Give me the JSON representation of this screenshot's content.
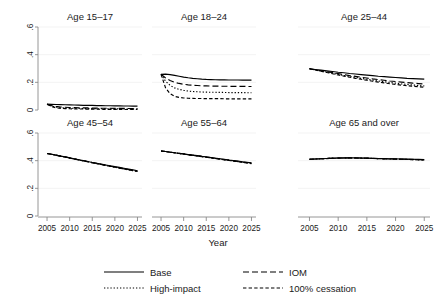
{
  "figure": {
    "xlabel": "Year",
    "y_ticks": [
      "0",
      ".2",
      ".4",
      ".6"
    ],
    "x_ticks": [
      "2005",
      "2010",
      "2015",
      "2020",
      "2025"
    ]
  },
  "legend": {
    "items": [
      {
        "label": "Base",
        "style": "solid",
        "key": "base"
      },
      {
        "label": "IOM",
        "style": "dashed",
        "key": "iom"
      },
      {
        "label": "High-impact",
        "style": "dotted",
        "key": "high_impact"
      },
      {
        "label": "100% cessation",
        "style": "dash-dot",
        "key": "cessation"
      }
    ]
  },
  "chart_data": {
    "type": "line",
    "title": "",
    "xlabel": "Year",
    "ylabel": "",
    "xlim": [
      2003,
      2026
    ],
    "ylim": [
      0,
      0.6
    ],
    "x_ticks": [
      2005,
      2010,
      2015,
      2020,
      2025
    ],
    "y_ticks": [
      0,
      0.2,
      0.4,
      0.6
    ],
    "grid": true,
    "legend_position": "bottom",
    "x": [
      2005,
      2006,
      2007,
      2008,
      2009,
      2010,
      2011,
      2012,
      2013,
      2014,
      2015,
      2016,
      2017,
      2018,
      2019,
      2020,
      2021,
      2022,
      2023,
      2024,
      2025
    ],
    "panels": [
      {
        "title": "Age 15–17",
        "series": [
          {
            "name": "Base",
            "style": "solid",
            "values": [
              0.042,
              0.041,
              0.04,
              0.039,
              0.038,
              0.037,
              0.036,
              0.035,
              0.034,
              0.034,
              0.033,
              0.032,
              0.032,
              0.031,
              0.031,
              0.03,
              0.03,
              0.029,
              0.029,
              0.028,
              0.028
            ]
          },
          {
            "name": "IOM",
            "style": "dashed",
            "values": [
              0.042,
              0.032,
              0.026,
              0.022,
              0.02,
              0.018,
              0.017,
              0.016,
              0.015,
              0.015,
              0.014,
              0.014,
              0.013,
              0.013,
              0.013,
              0.012,
              0.012,
              0.012,
              0.011,
              0.011,
              0.011
            ]
          },
          {
            "name": "High-impact",
            "style": "dotted",
            "values": [
              0.042,
              0.028,
              0.021,
              0.017,
              0.015,
              0.013,
              0.012,
              0.011,
              0.011,
              0.01,
              0.01,
              0.009,
              0.009,
              0.009,
              0.008,
              0.008,
              0.008,
              0.008,
              0.007,
              0.007,
              0.007
            ]
          },
          {
            "name": "100% cessation",
            "style": "dash-dot",
            "values": [
              0.042,
              0.024,
              0.016,
              0.012,
              0.01,
              0.009,
              0.008,
              0.007,
              0.007,
              0.006,
              0.006,
              0.006,
              0.005,
              0.005,
              0.005,
              0.005,
              0.004,
              0.004,
              0.004,
              0.004,
              0.004
            ]
          }
        ]
      },
      {
        "title": "Age 18–24",
        "series": [
          {
            "name": "Base",
            "style": "solid",
            "values": [
              0.258,
              0.259,
              0.256,
              0.25,
              0.244,
              0.238,
              0.233,
              0.229,
              0.226,
              0.223,
              0.221,
              0.22,
              0.219,
              0.218,
              0.218,
              0.217,
              0.217,
              0.217,
              0.216,
              0.216,
              0.216
            ]
          },
          {
            "name": "IOM",
            "style": "dashed",
            "values": [
              0.258,
              0.232,
              0.213,
              0.2,
              0.192,
              0.186,
              0.182,
              0.179,
              0.177,
              0.175,
              0.174,
              0.173,
              0.173,
              0.172,
              0.172,
              0.171,
              0.171,
              0.171,
              0.171,
              0.17,
              0.17
            ]
          },
          {
            "name": "High-impact",
            "style": "dotted",
            "values": [
              0.258,
              0.208,
              0.178,
              0.16,
              0.149,
              0.142,
              0.137,
              0.134,
              0.132,
              0.13,
              0.129,
              0.128,
              0.128,
              0.127,
              0.127,
              0.126,
              0.126,
              0.126,
              0.126,
              0.125,
              0.125
            ]
          },
          {
            "name": "100% cessation",
            "style": "dash-dot",
            "values": [
              0.258,
              0.16,
              0.118,
              0.099,
              0.091,
              0.087,
              0.085,
              0.084,
              0.083,
              0.083,
              0.082,
              0.082,
              0.082,
              0.082,
              0.081,
              0.081,
              0.081,
              0.081,
              0.081,
              0.081,
              0.081
            ]
          }
        ]
      },
      {
        "title": "Age 25–44",
        "series": [
          {
            "name": "Base",
            "style": "solid",
            "values": [
              0.298,
              0.293,
              0.288,
              0.283,
              0.278,
              0.273,
              0.269,
              0.264,
              0.26,
              0.256,
              0.252,
              0.248,
              0.244,
              0.241,
              0.238,
              0.235,
              0.232,
              0.229,
              0.227,
              0.225,
              0.223
            ]
          },
          {
            "name": "IOM",
            "style": "dashed",
            "values": [
              0.298,
              0.291,
              0.284,
              0.277,
              0.27,
              0.263,
              0.256,
              0.249,
              0.243,
              0.237,
              0.231,
              0.225,
              0.22,
              0.215,
              0.21,
              0.206,
              0.202,
              0.198,
              0.194,
              0.191,
              0.188
            ]
          },
          {
            "name": "High-impact",
            "style": "dotted",
            "values": [
              0.298,
              0.29,
              0.282,
              0.274,
              0.266,
              0.258,
              0.25,
              0.243,
              0.236,
              0.229,
              0.222,
              0.216,
              0.21,
              0.204,
              0.199,
              0.194,
              0.189,
              0.185,
              0.181,
              0.177,
              0.174
            ]
          },
          {
            "name": "100% cessation",
            "style": "dash-dot",
            "values": [
              0.298,
              0.289,
              0.28,
              0.271,
              0.262,
              0.253,
              0.245,
              0.237,
              0.229,
              0.222,
              0.215,
              0.208,
              0.202,
              0.196,
              0.19,
              0.185,
              0.18,
              0.176,
              0.172,
              0.168,
              0.165
            ]
          }
        ]
      },
      {
        "title": "Age 45–54",
        "series": [
          {
            "name": "Base",
            "style": "solid",
            "values": [
              0.452,
              0.446,
              0.44,
              0.433,
              0.427,
              0.42,
              0.413,
              0.407,
              0.4,
              0.394,
              0.387,
              0.381,
              0.375,
              0.369,
              0.363,
              0.357,
              0.351,
              0.345,
              0.339,
              0.333,
              0.327
            ]
          },
          {
            "name": "IOM",
            "style": "dashed",
            "values": [
              0.452,
              0.446,
              0.44,
              0.433,
              0.427,
              0.42,
              0.413,
              0.406,
              0.4,
              0.393,
              0.386,
              0.38,
              0.373,
              0.367,
              0.36,
              0.354,
              0.348,
              0.342,
              0.336,
              0.33,
              0.324
            ]
          },
          {
            "name": "High-impact",
            "style": "dotted",
            "values": [
              0.452,
              0.446,
              0.439,
              0.433,
              0.426,
              0.419,
              0.413,
              0.406,
              0.399,
              0.392,
              0.386,
              0.379,
              0.372,
              0.366,
              0.359,
              0.353,
              0.347,
              0.34,
              0.334,
              0.328,
              0.322
            ]
          },
          {
            "name": "100% cessation",
            "style": "dash-dot",
            "values": [
              0.452,
              0.446,
              0.439,
              0.432,
              0.426,
              0.419,
              0.412,
              0.405,
              0.398,
              0.392,
              0.385,
              0.378,
              0.372,
              0.365,
              0.359,
              0.352,
              0.346,
              0.34,
              0.334,
              0.328,
              0.322
            ]
          }
        ]
      },
      {
        "title": "Age 55–64",
        "series": [
          {
            "name": "Base",
            "style": "solid",
            "values": [
              0.47,
              0.466,
              0.462,
              0.457,
              0.453,
              0.449,
              0.444,
              0.44,
              0.436,
              0.431,
              0.427,
              0.423,
              0.418,
              0.414,
              0.41,
              0.405,
              0.401,
              0.397,
              0.392,
              0.388,
              0.384
            ]
          },
          {
            "name": "IOM",
            "style": "dashed",
            "values": [
              0.47,
              0.466,
              0.461,
              0.457,
              0.453,
              0.448,
              0.444,
              0.439,
              0.435,
              0.431,
              0.426,
              0.422,
              0.417,
              0.413,
              0.408,
              0.404,
              0.399,
              0.395,
              0.39,
              0.386,
              0.381
            ]
          },
          {
            "name": "High-impact",
            "style": "dotted",
            "values": [
              0.47,
              0.466,
              0.461,
              0.457,
              0.452,
              0.448,
              0.443,
              0.439,
              0.434,
              0.43,
              0.425,
              0.421,
              0.416,
              0.412,
              0.407,
              0.402,
              0.398,
              0.393,
              0.389,
              0.384,
              0.38
            ]
          },
          {
            "name": "100% cessation",
            "style": "dash-dot",
            "values": [
              0.47,
              0.466,
              0.461,
              0.457,
              0.452,
              0.448,
              0.443,
              0.438,
              0.434,
              0.429,
              0.425,
              0.42,
              0.415,
              0.411,
              0.406,
              0.402,
              0.397,
              0.392,
              0.388,
              0.383,
              0.379
            ]
          }
        ]
      },
      {
        "title": "Age 65 and over",
        "series": [
          {
            "name": "Base",
            "style": "solid",
            "values": [
              0.41,
              0.412,
              0.414,
              0.416,
              0.418,
              0.419,
              0.42,
              0.42,
              0.42,
              0.419,
              0.418,
              0.417,
              0.416,
              0.415,
              0.414,
              0.413,
              0.412,
              0.411,
              0.41,
              0.409,
              0.408
            ]
          },
          {
            "name": "IOM",
            "style": "dashed",
            "values": [
              0.41,
              0.412,
              0.414,
              0.416,
              0.417,
              0.419,
              0.419,
              0.42,
              0.419,
              0.419,
              0.418,
              0.417,
              0.415,
              0.414,
              0.413,
              0.412,
              0.411,
              0.41,
              0.409,
              0.408,
              0.407
            ]
          },
          {
            "name": "High-impact",
            "style": "dotted",
            "values": [
              0.41,
              0.412,
              0.414,
              0.416,
              0.417,
              0.418,
              0.419,
              0.419,
              0.419,
              0.418,
              0.417,
              0.416,
              0.415,
              0.414,
              0.412,
              0.411,
              0.41,
              0.409,
              0.408,
              0.407,
              0.406
            ]
          },
          {
            "name": "100% cessation",
            "style": "dash-dot",
            "values": [
              0.41,
              0.412,
              0.414,
              0.415,
              0.417,
              0.418,
              0.419,
              0.419,
              0.419,
              0.418,
              0.417,
              0.416,
              0.414,
              0.413,
              0.412,
              0.411,
              0.41,
              0.409,
              0.407,
              0.406,
              0.405
            ]
          }
        ]
      }
    ]
  }
}
